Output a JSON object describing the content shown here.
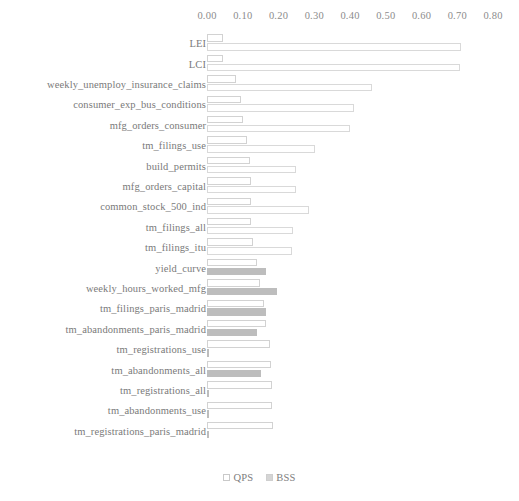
{
  "chart_data": {
    "type": "bar",
    "orientation": "horizontal",
    "title": "",
    "xlabel": "",
    "ylabel": "",
    "xlim": [
      0.0,
      0.8
    ],
    "grid": false,
    "legend_position": "bottom-center",
    "tick_labels": [
      "0.00",
      "0.10",
      "0.20",
      "0.30",
      "0.40",
      "0.50",
      "0.60",
      "0.70",
      "0.80"
    ],
    "tick_values": [
      0.0,
      0.1,
      0.2,
      0.3,
      0.4,
      0.5,
      0.6,
      0.7,
      0.8
    ],
    "categories": [
      "LEI",
      "LCI",
      "weekly_unemploy_insurance_claims",
      "consumer_exp_bus_conditions",
      "mfg_orders_consumer",
      "tm_filings_use",
      "build_permits",
      "mfg_orders_capital",
      "common_stock_500_ind",
      "tm_filings_all",
      "tm_filings_itu",
      "yield_curve",
      "weekly_hours_worked_mfg",
      "tm_filings_paris_madrid",
      "tm_abandonments_paris_madrid",
      "tm_registrations_use",
      "tm_abandonments_all",
      "tm_registrations_all",
      "tm_abandonments_use",
      "tm_registrations_paris_madrid"
    ],
    "series": [
      {
        "name": "QPS",
        "color": "#ffffff",
        "edge_color": "#d2d2d2",
        "values": [
          0.045,
          0.045,
          0.08,
          0.095,
          0.1,
          0.113,
          0.12,
          0.122,
          0.124,
          0.124,
          0.128,
          0.14,
          0.148,
          0.16,
          0.165,
          0.175,
          0.178,
          0.182,
          0.183,
          0.185
        ]
      },
      {
        "name": "BSS",
        "color": "#bdbdbd",
        "edge_color": "#bdbdbd",
        "values": [
          0.71,
          0.708,
          0.462,
          0.41,
          0.4,
          0.302,
          0.25,
          0.248,
          0.285,
          0.24,
          0.237,
          0.165,
          0.195,
          0.165,
          0.14,
          0.006,
          0.15,
          0.004,
          0.003,
          0.0
        ]
      }
    ]
  },
  "legend": {
    "items": [
      {
        "label": "QPS",
        "swatch": "qps-swatch"
      },
      {
        "label": "BSS",
        "swatch": "bss-swatch"
      }
    ]
  }
}
